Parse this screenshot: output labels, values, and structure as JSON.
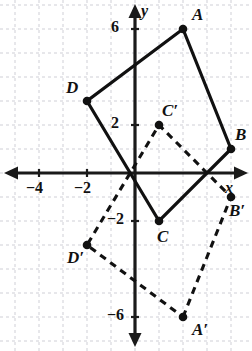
{
  "figure": {
    "grid": {
      "visible": true,
      "color": "#cfcfd6",
      "style": "dashed",
      "spacing_units": 1
    },
    "axes": {
      "color": "#1a1a1a",
      "x_axis_label": "x",
      "y_axis_label": "y",
      "x_ticks": [
        {
          "value": -4,
          "label": "−4"
        },
        {
          "value": -2,
          "label": "−2"
        }
      ],
      "y_ticks": [
        {
          "value": 6,
          "label": "6"
        },
        {
          "value": 2,
          "label": "2"
        },
        {
          "value": -2,
          "label": "−2"
        },
        {
          "value": -6,
          "label": "−6"
        }
      ],
      "xlim": [
        -5,
        4.9
      ],
      "ylim": [
        -7.3,
        7.3
      ]
    },
    "shapes": [
      {
        "name": "quadrilateral-abcd",
        "style": "solid",
        "color": "#111111",
        "vertices": [
          {
            "label": "A",
            "x": 2,
            "y": 6
          },
          {
            "label": "B",
            "x": 4,
            "y": 1
          },
          {
            "label": "C",
            "x": 1,
            "y": -2
          },
          {
            "label": "D",
            "x": -2,
            "y": 3
          }
        ]
      },
      {
        "name": "quadrilateral-a-prime-b-prime-c-prime-d-prime",
        "style": "dashed",
        "color": "#111111",
        "vertices": [
          {
            "label": "A′",
            "x": 2,
            "y": -6
          },
          {
            "label": "B′",
            "x": 4,
            "y": -1
          },
          {
            "label": "C′",
            "x": 1,
            "y": 2
          },
          {
            "label": "D′",
            "x": -2,
            "y": -3
          }
        ]
      }
    ]
  },
  "chart_data": {
    "type": "scatter",
    "title": "",
    "xlabel": "x",
    "ylabel": "y",
    "xlim": [
      -5,
      4.9
    ],
    "ylim": [
      -7.3,
      7.3
    ],
    "grid": true,
    "legend": "none",
    "series": [
      {
        "name": "ABCD",
        "style": "solid",
        "closed": true,
        "points": [
          {
            "label": "A",
            "x": 2,
            "y": 6
          },
          {
            "label": "B",
            "x": 4,
            "y": 1
          },
          {
            "label": "C",
            "x": 1,
            "y": -2
          },
          {
            "label": "D",
            "x": -2,
            "y": 3
          }
        ]
      },
      {
        "name": "A'B'C'D'",
        "style": "dashed",
        "closed": true,
        "points": [
          {
            "label": "A′",
            "x": 2,
            "y": -6
          },
          {
            "label": "B′",
            "x": 4,
            "y": -1
          },
          {
            "label": "C′",
            "x": 1,
            "y": 2
          },
          {
            "label": "D′",
            "x": -2,
            "y": -3
          }
        ]
      }
    ],
    "x_tick_labels": [
      "−4",
      "−2"
    ],
    "y_tick_labels": [
      "6",
      "2",
      "−2",
      "−6"
    ]
  },
  "labels": {
    "A": "A",
    "B": "B",
    "C": "C",
    "D": "D",
    "Ap": "A′",
    "Bp": "B′",
    "Cp": "C′",
    "Dp": "D′",
    "x_axis": "x",
    "y_axis": "y",
    "tick_x_m4": "−4",
    "tick_x_m2": "−2",
    "tick_y_6": "6",
    "tick_y_2": "2",
    "tick_y_m2": "−2",
    "tick_y_m6": "−6"
  }
}
